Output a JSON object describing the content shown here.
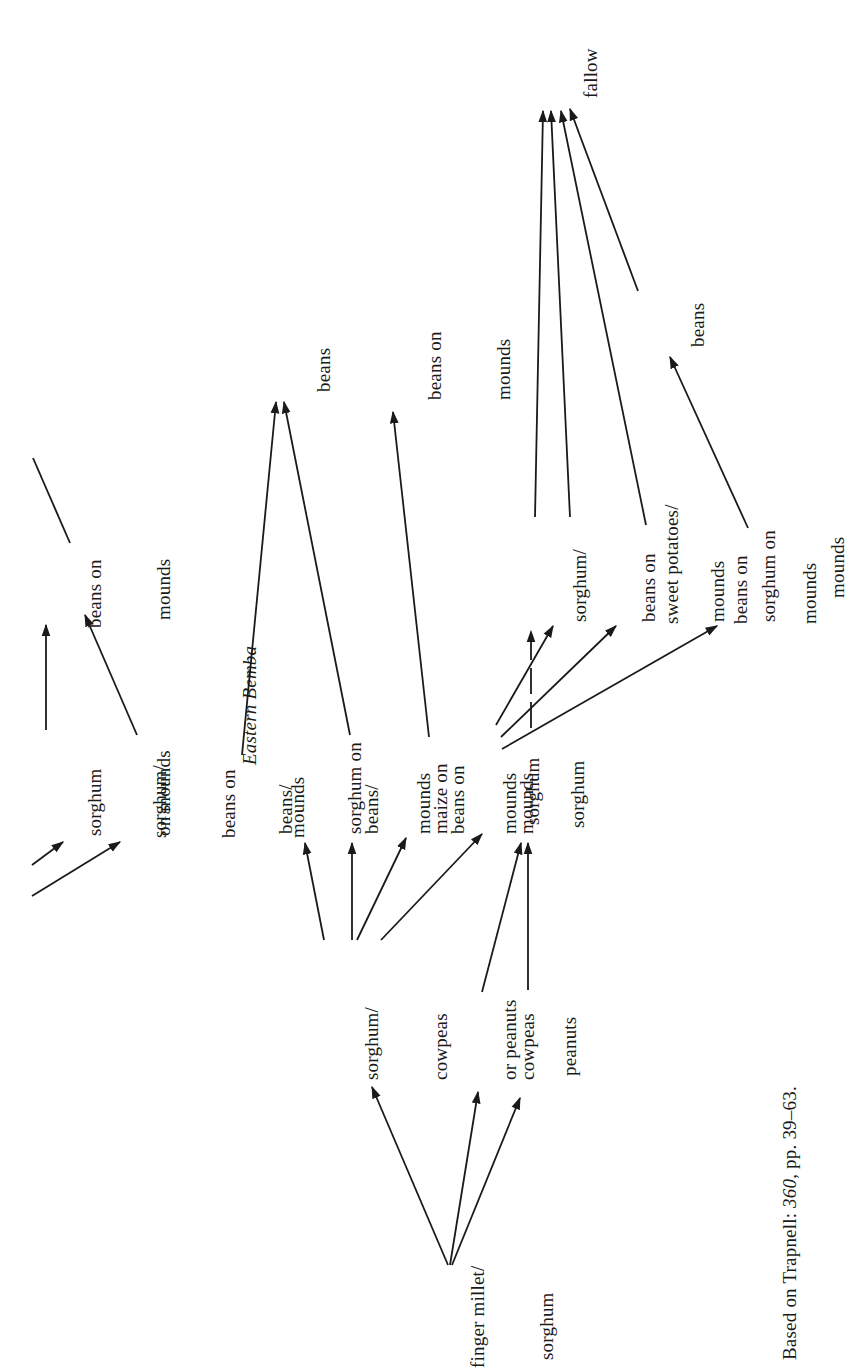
{
  "diagram": {
    "title": "Eastern Bemba",
    "orientation": "rotated 90° counter-clockwise",
    "caption": "Based on Trapnell: 360, pp. 39–63.",
    "caption_parts": {
      "prefix": "Based on Trapnell: ",
      "ref": "360",
      "suffix": ", pp. 39–63."
    },
    "nodes": {
      "top_sorghum_on_mounds": [
        "sorghum",
        "on mounds"
      ],
      "top_sorghum_beans_on_mounds": [
        "sorghum/",
        "beans on",
        "mounds"
      ],
      "top_beans_on_mounds": [
        "beans on",
        "mounds"
      ],
      "section_title": "Eastern Bemba",
      "beans_sorghum_on_mounds": [
        "beans/",
        "sorghum on",
        "mounds"
      ],
      "beans_maize_on_mounds": [
        "beans/",
        "maize on",
        "mounds"
      ],
      "mid_beans_on_mounds": [
        "beans on",
        "mounds"
      ],
      "beans_target": [
        "beans"
      ],
      "beans_on_mounds_target": [
        "beans on",
        "mounds"
      ],
      "sorghum_a": [
        "sorghum"
      ],
      "sorghum_b": [
        "sorghum"
      ],
      "sorghum_beans_on_mounds_r": [
        "sorghum/",
        "beans on",
        "mounds"
      ],
      "sweet_potatoes_beans_on_mounds": [
        "sweet potatoes/",
        "beans on",
        "mounds"
      ],
      "sorghum_on_mounds_r": [
        "sorghum on",
        "mounds"
      ],
      "fallow": [
        "fallow"
      ],
      "beans_right": [
        "beans"
      ],
      "sorghum_cowpeas_or_peanuts": [
        "sorghum/",
        "cowpeas",
        "or peanuts"
      ],
      "cowpeas": [
        "cowpeas"
      ],
      "peanuts": [
        "peanuts"
      ],
      "finger_millet_sorghum": [
        "finger millet/",
        "sorghum"
      ]
    },
    "edges": [
      {
        "from": "finger millet/sorghum",
        "to": "sorghum/cowpeas or peanuts"
      },
      {
        "from": "finger millet/sorghum",
        "to": "cowpeas"
      },
      {
        "from": "finger millet/sorghum",
        "to": "peanuts"
      },
      {
        "from": "sorghum/cowpeas or peanuts",
        "to": "beans/sorghum on mounds"
      },
      {
        "from": "sorghum/cowpeas or peanuts",
        "to": "beans/maize on mounds"
      },
      {
        "from": "sorghum/cowpeas or peanuts",
        "to": "beans on mounds"
      },
      {
        "from": "sorghum/cowpeas or peanuts",
        "to": "sorghum"
      },
      {
        "from": "cowpeas",
        "to": "sorghum (2)"
      },
      {
        "from": "peanuts",
        "to": "sorghum (2)"
      },
      {
        "from": "beans/sorghum on mounds",
        "to": "beans"
      },
      {
        "from": "beans/maize on mounds",
        "to": "beans"
      },
      {
        "from": "beans on mounds",
        "to": "beans on mounds (target)"
      },
      {
        "from": "sorghum",
        "to": "sorghum/beans on mounds"
      },
      {
        "from": "sorghum",
        "to": "sweet potatoes/beans on mounds"
      },
      {
        "from": "sorghum",
        "to": "sorghum on mounds"
      },
      {
        "from": "sorghum (2)",
        "to": "sorghum/beans on mounds",
        "style": "dashed"
      },
      {
        "from": "sorghum/beans on mounds",
        "to": "fallow"
      },
      {
        "from": "sorghum/beans on mounds",
        "to": "fallow"
      },
      {
        "from": "sweet potatoes/beans on mounds",
        "to": "fallow"
      },
      {
        "from": "beans",
        "to": "fallow"
      },
      {
        "from": "sorghum on mounds",
        "to": "beans"
      },
      {
        "from": "sorghum on mounds (top)",
        "to": "beans on mounds (top)"
      },
      {
        "from": "sorghum/beans on mounds (top)",
        "to": "beans on mounds (top)"
      }
    ]
  }
}
